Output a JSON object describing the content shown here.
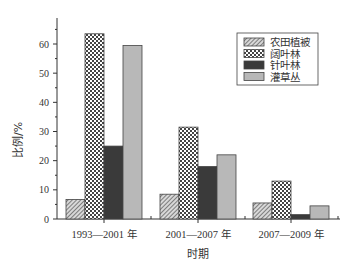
{
  "chart_data": {
    "type": "bar",
    "title": "",
    "xlabel": "时期",
    "ylabel": "比例/%",
    "categories": [
      "1993—2001 年",
      "2001—2007 年",
      "2007—2009 年"
    ],
    "series": [
      {
        "name": "农田植被",
        "values": [
          6.7,
          8.5,
          5.5
        ],
        "pattern": "diagonal-hatch",
        "color": "#9a9a9a"
      },
      {
        "name": "阔叶林",
        "values": [
          63.5,
          31.5,
          13.0
        ],
        "pattern": "crosshatch",
        "color": "#ffffff"
      },
      {
        "name": "针叶林",
        "values": [
          25.0,
          18.0,
          1.5
        ],
        "pattern": "solid",
        "color": "#3a3a3a"
      },
      {
        "name": "灌草丛",
        "values": [
          59.5,
          22.0,
          4.5
        ],
        "pattern": "solid",
        "color": "#b8b8b8"
      }
    ],
    "yticks": [
      0,
      10,
      20,
      30,
      40,
      50,
      60
    ],
    "ylim": [
      0,
      66
    ],
    "grid": false,
    "legend_position": "upper right"
  },
  "labels": {
    "xlabel": "时期",
    "ylabel": "比例/%"
  }
}
